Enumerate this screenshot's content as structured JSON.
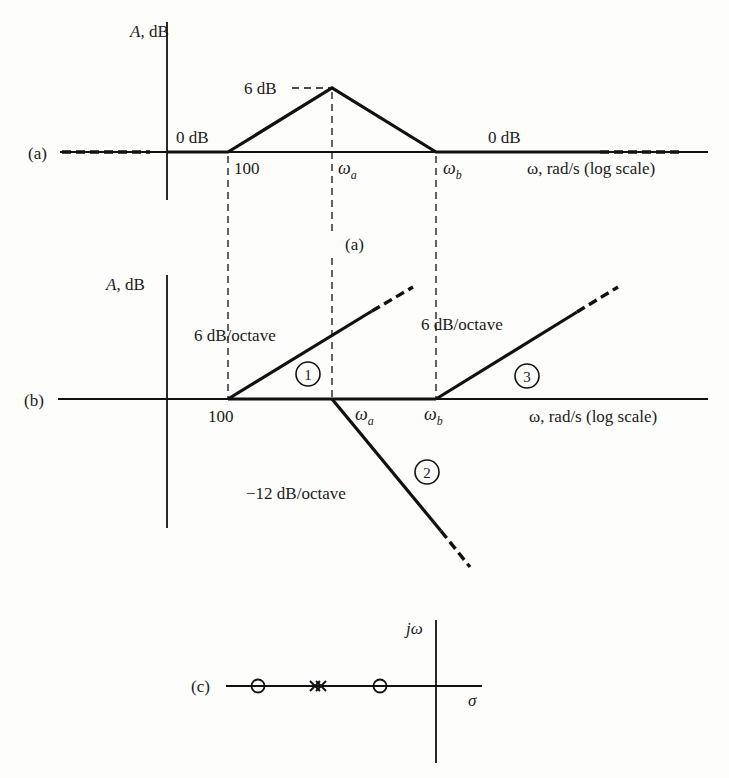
{
  "figure": {
    "panel_a": {
      "label": "(a)",
      "caption": "(a)",
      "y_axis_label_main": "A",
      "y_axis_label_unit": ", dB",
      "x_axis_label": "ω, rad/s (log scale)",
      "low_level": "0 dB",
      "high_level": "0 dB",
      "peak_label": "6 dB",
      "breakpoints": {
        "first": "100",
        "second_main": "ω",
        "second_sub": "a",
        "third_main": "ω",
        "third_sub": "b"
      }
    },
    "panel_b": {
      "label": "(b)",
      "y_axis_label_main": "A",
      "y_axis_label_unit": ", dB",
      "x_axis_label": "ω, rad/s (log scale)",
      "breakpoints": {
        "first": "100",
        "second_main": "ω",
        "second_sub": "a",
        "third_main": "ω",
        "third_sub": "b"
      },
      "asymptotes": [
        {
          "id": "1",
          "slope_label": "6 dB/octave"
        },
        {
          "id": "2",
          "slope_label": "−12 dB/octave"
        },
        {
          "id": "3",
          "slope_label": "6 dB/octave"
        }
      ]
    },
    "panel_c": {
      "label": "(c)",
      "imag_axis_label": "jω",
      "real_axis_label": "σ",
      "zeros": 2,
      "poles": 2,
      "pole_symbol": "×",
      "zero_symbol": "○"
    }
  }
}
